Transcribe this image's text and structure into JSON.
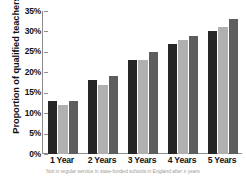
{
  "chart_data": {
    "type": "bar",
    "title": "",
    "subtitle": "",
    "xlabel": "",
    "ylabel": "Proportion of qualified teachers",
    "categories": [
      "1 Year",
      "2 Years",
      "3 Years",
      "4 Years",
      "5 Years"
    ],
    "series": [
      {
        "name": "Series 1",
        "color": "#262626",
        "values": [
          13,
          18,
          23,
          27,
          30
        ]
      },
      {
        "name": "Series 2",
        "color": "#b0b0b0",
        "values": [
          12,
          17,
          23,
          28,
          31
        ]
      },
      {
        "name": "Series 3",
        "color": "#5e5e5e",
        "values": [
          13,
          19,
          25,
          29,
          33
        ]
      }
    ],
    "ylim": [
      0,
      35
    ],
    "ytick_values": [
      0,
      5,
      10,
      15,
      20,
      25,
      30,
      35
    ],
    "ytick_labels": [
      "0%",
      "5%",
      "10%",
      "15%",
      "20%",
      "25%",
      "30%",
      "35%"
    ],
    "grid": false,
    "legend": "none",
    "value_suffix": "%"
  },
  "caption": {
    "text": "Not in regular service in state-funded schools in England after x years"
  }
}
